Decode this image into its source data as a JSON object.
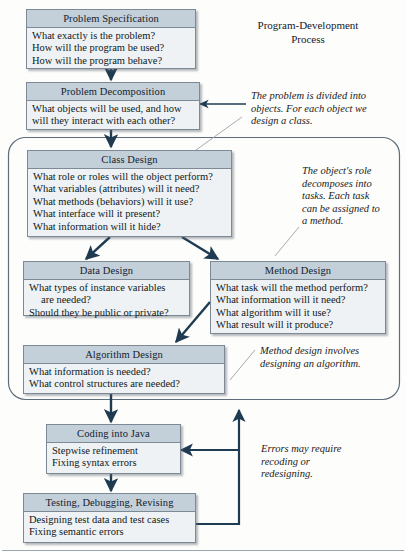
{
  "diagram": {
    "title": {
      "line1": "Program-Development",
      "line2": "Process"
    },
    "nodes": [
      {
        "id": "problem-specification",
        "title": "Problem Specification",
        "lines": [
          "What exactly is the problem?",
          "How will the program be used?",
          "How will the program behave?"
        ]
      },
      {
        "id": "problem-decomposition",
        "title": "Problem Decomposition",
        "lines": [
          "What objects will be used, and how",
          "will they interact with each other?"
        ]
      },
      {
        "id": "class-design",
        "title": "Class Design",
        "lines": [
          "What role or roles will the object perform?",
          "What variables (attributes) will it need?",
          "What methods (behaviors) will it use?",
          "What interface will it present?",
          "What information will it hide?"
        ]
      },
      {
        "id": "data-design",
        "title": "Data Design",
        "lines": [
          "What types of instance variables",
          "are needed?",
          "Should they be public or private?"
        ]
      },
      {
        "id": "method-design",
        "title": "Method Design",
        "lines": [
          "What task will the method perform?",
          "What information will it need?",
          "What algorithm will it use?",
          "What result will it produce?"
        ]
      },
      {
        "id": "algorithm-design",
        "title": "Algorithm Design",
        "lines": [
          "What information is needed?",
          "What control structures are needed?"
        ]
      },
      {
        "id": "coding-into-java",
        "title": "Coding into Java",
        "lines": [
          "Stepwise refinement",
          "Fixing syntax errors"
        ]
      },
      {
        "id": "testing-debugging-revising",
        "title": "Testing, Debugging, Revising",
        "lines": [
          "Designing test data and test cases",
          "Fixing semantic errors"
        ]
      }
    ],
    "annotations": [
      {
        "id": "annot-decomposition",
        "lines": [
          "The problem is divided into",
          "objects. For each object we",
          "design a class."
        ]
      },
      {
        "id": "annot-class-role",
        "lines": [
          "The object's role",
          "decomposes into",
          "tasks. Each task",
          "can be assigned to",
          "a method."
        ]
      },
      {
        "id": "annot-method-design",
        "lines": [
          "Method design involves",
          "designing an algorithm."
        ]
      },
      {
        "id": "annot-errors",
        "lines": [
          "Errors may require",
          "recoding or",
          "redesigning."
        ]
      }
    ],
    "colors": {
      "node_header": "#c3cfd9",
      "node_body": "#eef2f4",
      "node_border": "#7d8a96",
      "arrow": "#1f3b52",
      "leader": "#8b9199",
      "page": "#fdfdfb"
    }
  }
}
